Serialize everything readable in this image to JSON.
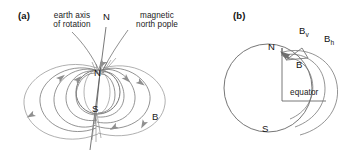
{
  "figure": {
    "background_color": "#ffffff",
    "line_color": "#6e6e6e",
    "arrow_color": "#8a8a8a",
    "text_color": "#1a1a1a",
    "width": 358,
    "height": 168
  },
  "panel_a": {
    "tag": "(a)",
    "axis_caption_line1": "earth axis",
    "axis_caption_line2": "of rotation",
    "magnetic_caption_line1": "magnetic",
    "magnetic_caption_line2": "north pople",
    "geographic_north_label": "N",
    "earth_north_pole_label": "N",
    "earth_south_pole_label": "S",
    "field_label": "B"
  },
  "panel_b": {
    "tag": "(b)",
    "north_label": "N",
    "south_label": "S",
    "equator_label": "equator",
    "vertical_component": "B",
    "vertical_component_sub": "v",
    "horizontal_component": "B",
    "horizontal_component_sub": "h",
    "resultant_label": "B"
  }
}
